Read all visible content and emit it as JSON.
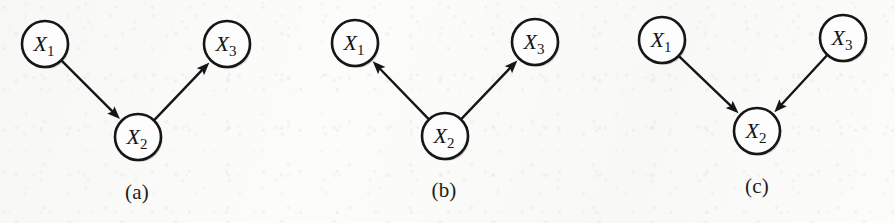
{
  "figure": {
    "width": 895,
    "height": 223,
    "background_color": "#fcfcfb",
    "ink_color": "#161616",
    "node_fill_color": "#fdfdfd",
    "node_radius": 23,
    "panels": [
      {
        "caption": "(a)",
        "caption_x": 137,
        "caption_y": 192,
        "structure": "chain",
        "nodes": [
          {
            "id": "X1",
            "base": "X",
            "sub": "1",
            "cx": 45,
            "cy": 44
          },
          {
            "id": "X2",
            "base": "X",
            "sub": "2",
            "cx": 138,
            "cy": 137
          },
          {
            "id": "X3",
            "base": "X",
            "sub": "3",
            "cx": 227,
            "cy": 44
          }
        ],
        "edges": [
          {
            "from": "X1",
            "to": "X2",
            "arrow": "to"
          },
          {
            "from": "X2",
            "to": "X3",
            "arrow": "to"
          }
        ]
      },
      {
        "caption": "(b)",
        "caption_x": 444,
        "caption_y": 190,
        "structure": "fork",
        "nodes": [
          {
            "id": "X1",
            "base": "X",
            "sub": "1",
            "cx": 355,
            "cy": 43
          },
          {
            "id": "X2",
            "base": "X",
            "sub": "2",
            "cx": 445,
            "cy": 136
          },
          {
            "id": "X3",
            "base": "X",
            "sub": "3",
            "cx": 535,
            "cy": 42
          }
        ],
        "edges": [
          {
            "from": "X2",
            "to": "X1",
            "arrow": "to"
          },
          {
            "from": "X2",
            "to": "X3",
            "arrow": "to"
          }
        ]
      },
      {
        "caption": "(c)",
        "caption_x": 757,
        "caption_y": 186,
        "structure": "collider",
        "nodes": [
          {
            "id": "X1",
            "base": "X",
            "sub": "1",
            "cx": 662,
            "cy": 40
          },
          {
            "id": "X2",
            "base": "X",
            "sub": "2",
            "cx": 757,
            "cy": 131
          },
          {
            "id": "X3",
            "base": "X",
            "sub": "3",
            "cx": 843,
            "cy": 38
          }
        ],
        "edges": [
          {
            "from": "X1",
            "to": "X2",
            "arrow": "to"
          },
          {
            "from": "X3",
            "to": "X2",
            "arrow": "to"
          }
        ]
      }
    ]
  }
}
